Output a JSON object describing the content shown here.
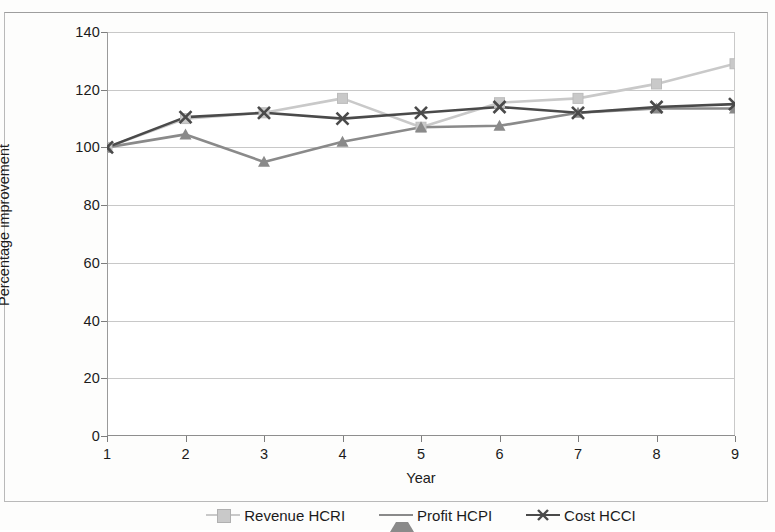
{
  "chart_data": {
    "type": "line",
    "title": "",
    "xlabel": "Year",
    "ylabel": "Percentage improvement",
    "x": [
      1,
      2,
      3,
      4,
      5,
      6,
      7,
      8,
      9
    ],
    "categories": [
      "1",
      "2",
      "3",
      "4",
      "5",
      "6",
      "7",
      "8",
      "9"
    ],
    "xlim": [
      1,
      9
    ],
    "ylim": [
      0,
      140
    ],
    "yticks": [
      0,
      20,
      40,
      60,
      80,
      100,
      120,
      140
    ],
    "ytick_labels": [
      "0",
      "20",
      "40",
      "60",
      "80",
      "100",
      "120",
      "140"
    ],
    "grid": "horizontal",
    "legend_position": "bottom",
    "series": [
      {
        "name": "Revenue HCRI",
        "marker": "square",
        "color": "#c9c9c9",
        "values": [
          100,
          110,
          112,
          117,
          107,
          115.5,
          117,
          122,
          129
        ]
      },
      {
        "name": "Profit HCPI",
        "marker": "triangle",
        "color": "#8a8a8a",
        "values": [
          100,
          104.5,
          95,
          102,
          107,
          107.5,
          112,
          113.5,
          113.5
        ]
      },
      {
        "name": "Cost HCCI",
        "marker": "x",
        "color": "#4a4a4a",
        "values": [
          100,
          110.5,
          112,
          110,
          112,
          114,
          112,
          114,
          115
        ]
      }
    ]
  },
  "legend": {
    "items": [
      {
        "label": "Revenue HCRI"
      },
      {
        "label": "Profit HCPI"
      },
      {
        "label": "Cost HCCI"
      }
    ]
  },
  "axes": {
    "y_title": "Percentage improvement",
    "x_title": "Year"
  }
}
